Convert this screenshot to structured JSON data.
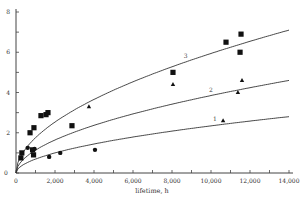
{
  "chart_data": {
    "type": "scatter",
    "title": "",
    "xlabel": "lifetime, h",
    "ylabel": "",
    "xlim": [
      0,
      14000
    ],
    "ylim": [
      0,
      8
    ],
    "grid": false,
    "x_ticks": [
      0,
      2000,
      4000,
      6000,
      8000,
      10000,
      12000,
      14000
    ],
    "x_tick_labels": [
      "0",
      "2,000",
      "4,000",
      "6,000",
      "8,000",
      "10,000",
      "12,000",
      "14,000"
    ],
    "y_ticks": [
      0,
      2,
      4,
      6,
      8
    ],
    "y_tick_labels": [
      "0",
      "2",
      "4",
      "6",
      "8"
    ],
    "curves": [
      {
        "name": "1",
        "label": "1",
        "model": "power",
        "y_at_14000": 2.8,
        "exponent": 0.53
      },
      {
        "name": "2",
        "label": "2",
        "model": "power",
        "y_at_14000": 4.6,
        "exponent": 0.53
      },
      {
        "name": "3",
        "label": "3",
        "model": "power",
        "y_at_14000": 7.1,
        "exponent": 0.53
      }
    ],
    "series": [
      {
        "name": "squares",
        "marker": "square",
        "points": [
          [
            250,
            0.75
          ],
          [
            300,
            1.0
          ],
          [
            850,
            1.15
          ],
          [
            900,
            0.9
          ],
          [
            720,
            2.0
          ],
          [
            920,
            2.25
          ],
          [
            1280,
            2.85
          ],
          [
            1540,
            2.9
          ],
          [
            1640,
            3.0
          ],
          [
            2870,
            2.35
          ],
          [
            8050,
            5.0
          ],
          [
            10770,
            6.5
          ],
          [
            11540,
            6.9
          ],
          [
            11490,
            6.0
          ]
        ]
      },
      {
        "name": "triangles",
        "marker": "triangle",
        "points": [
          [
            3740,
            3.3
          ],
          [
            8050,
            4.4
          ],
          [
            11590,
            4.6
          ],
          [
            11380,
            4.0
          ],
          [
            10620,
            2.6
          ]
        ]
      },
      {
        "name": "circles",
        "marker": "circle",
        "points": [
          [
            600,
            1.25
          ],
          [
            950,
            1.2
          ],
          [
            1700,
            0.8
          ],
          [
            2270,
            1.0
          ],
          [
            4050,
            1.15
          ]
        ]
      }
    ]
  }
}
